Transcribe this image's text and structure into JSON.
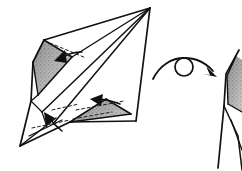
{
  "document": {
    "kind": "origami-instruction-diagram",
    "background_color": "#ffffff",
    "ink_color": "#111111",
    "shading_color": "#9a9a9a",
    "width": 242,
    "height": 171,
    "caption": "",
    "step_number": ""
  },
  "symbols": {
    "turn_over": {
      "name": "turn-over-symbol",
      "label": "",
      "description": "arc with circle and arrowhead indicating turn the model over",
      "circle_center_x": 184,
      "circle_center_y": 67,
      "circle_radius": 9
    },
    "insert_arrows": [
      {
        "name": "insert-arrow-upper-pocket",
        "label": "",
        "direction": "down-left"
      },
      {
        "name": "insert-arrow-lower-pocket",
        "label": "",
        "direction": "up-left"
      },
      {
        "name": "insert-arrow-tail",
        "label": "",
        "direction": "up-left"
      }
    ]
  },
  "figures": [
    {
      "name": "main-model",
      "label": "",
      "shaded_pockets": 2,
      "description": "diamond shaped folded paper model with pointed lower-left tail"
    },
    {
      "name": "result-model-partial",
      "label": "",
      "shaded_pockets": 1,
      "description": "partially visible next-step model at right edge"
    }
  ],
  "legend": {
    "dashed_line_meaning": "valley fold line",
    "solid_arrow_meaning": "insert / tuck direction",
    "shaded_area_meaning": "reverse side of paper"
  }
}
